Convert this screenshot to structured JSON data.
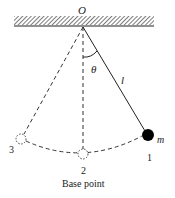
{
  "diagram": {
    "type": "pendulum",
    "labels": {
      "pivot": "O",
      "angle": "θ",
      "length": "l",
      "mass": "m",
      "position_1": "1",
      "position_2": "2",
      "position_3": "3",
      "caption": "Base point"
    },
    "colors": {
      "line": "#222222",
      "bob": "#000000",
      "background": "#ffffff"
    }
  }
}
